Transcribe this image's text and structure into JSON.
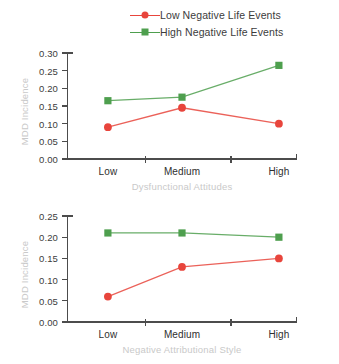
{
  "legend": {
    "position": "top-center",
    "items": [
      {
        "label": "Low Negative Life Events",
        "marker": "circle",
        "color": "#e8453c"
      },
      {
        "label": "High Negative Life Events",
        "marker": "square",
        "color": "#4e9f4e"
      }
    ]
  },
  "colors": {
    "low_negative_life_events": "#e8453c",
    "high_negative_life_events": "#4e9f4e",
    "axis": "#4c4c4c",
    "axis_title": "#c9c9c9",
    "tick_label": "#3c3c3c"
  },
  "chart_data": [
    {
      "type": "line",
      "panel": "top",
      "title": "",
      "xlabel": "Dysfunctional Attitudes",
      "ylabel": "MDD Incidence",
      "categories": [
        "Low",
        "Medium",
        "High"
      ],
      "ylim": [
        0.0,
        0.3
      ],
      "yticks": [
        "0.00",
        "0.05",
        "0.10",
        "0.15",
        "0.20",
        "0.25",
        "0.30"
      ],
      "ytick_values": [
        0.0,
        0.05,
        0.1,
        0.15,
        0.2,
        0.25,
        0.3
      ],
      "grid": false,
      "legend": "top",
      "series": [
        {
          "name": "Low Negative Life Events",
          "marker": "circle",
          "color": "#e8453c",
          "values": [
            0.09,
            0.145,
            0.1
          ]
        },
        {
          "name": "High Negative Life Events",
          "marker": "square",
          "color": "#4e9f4e",
          "values": [
            0.165,
            0.175,
            0.265
          ]
        }
      ]
    },
    {
      "type": "line",
      "panel": "bottom",
      "title": "",
      "xlabel": "Negative Attributional Style",
      "ylabel": "MDD Incidence",
      "categories": [
        "Low",
        "Medium",
        "High"
      ],
      "ylim": [
        0.0,
        0.25
      ],
      "yticks": [
        "0.00",
        "0.05",
        "0.10",
        "0.15",
        "0.20",
        "0.25"
      ],
      "ytick_values": [
        0.0,
        0.05,
        0.1,
        0.15,
        0.2,
        0.25
      ],
      "grid": false,
      "legend": "none",
      "series": [
        {
          "name": "Low Negative Life Events",
          "marker": "circle",
          "color": "#e8453c",
          "values": [
            0.06,
            0.13,
            0.15
          ]
        },
        {
          "name": "High Negative Life Events",
          "marker": "square",
          "color": "#4e9f4e",
          "values": [
            0.21,
            0.21,
            0.2
          ]
        }
      ]
    }
  ]
}
